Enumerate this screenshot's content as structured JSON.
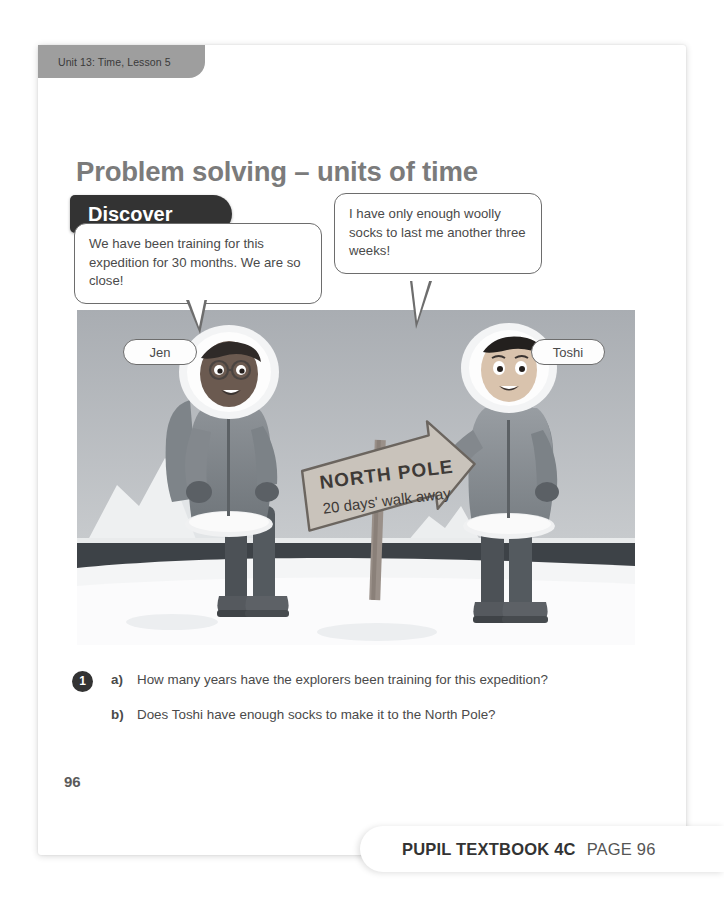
{
  "unit_tab": {
    "label": "Unit 13: Time, Lesson 5"
  },
  "title": "Problem solving – units of time",
  "section_badge": {
    "label": "Discover"
  },
  "speech_bubbles": [
    {
      "speaker": "Jen",
      "text": "We have been training for this expedition for 30 months. We are so close!"
    },
    {
      "speaker": "Toshi",
      "text": "I have only enough woolly socks to last me another three weeks!"
    }
  ],
  "illustration": {
    "description": "Two explorers in fur-hooded parkas standing on snow beside a wooden signpost, with an iceberg and dark sea behind them",
    "signpost": {
      "line1": "NORTH POLE",
      "line2": "20 days' walk away"
    },
    "labels": {
      "left": "Jen",
      "right": "Toshi"
    }
  },
  "questions": {
    "number": "1",
    "items": [
      {
        "letter": "a)",
        "text": "How many years have the explorers been training for this expedition?"
      },
      {
        "letter": "b)",
        "text": "Does Toshi have enough socks to make it to the North Pole?"
      }
    ]
  },
  "page_number": "96",
  "footer": {
    "book": "PUPIL TEXTBOOK 4C",
    "page": "PAGE 96"
  },
  "colors": {
    "tab_background": "#9e9e9e",
    "title_text": "#7b7b7b",
    "badge_background": "#333333",
    "body_text": "#4a4a4a",
    "sky": "#b9bcc0",
    "snow": "#f2f3f4",
    "sea": "#3d4247"
  }
}
